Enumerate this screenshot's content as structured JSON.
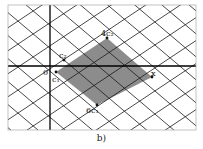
{
  "figure": {
    "caption": "b)",
    "labels": {
      "origin": "0",
      "c1": "c₁",
      "c2": "c₂",
      "four_c2": "4c₂",
      "x": "x",
      "six_c1": "6c₁"
    },
    "colors": {
      "grid": "#1a1a1a",
      "shade": "#8c8c8c",
      "background": "#ffffff"
    }
  }
}
